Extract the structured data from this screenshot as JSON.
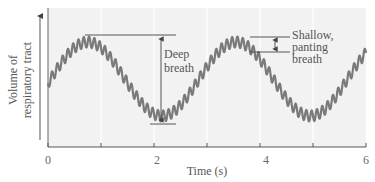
{
  "chart_data": {
    "type": "line",
    "title": "",
    "xlabel": "Time (s)",
    "ylabel": "Volume of respiratory tract",
    "ylabel_lines": [
      "Volume of",
      "respiratory tract"
    ],
    "xlim": [
      0,
      6
    ],
    "x_ticks": [
      0,
      1,
      2,
      3,
      4,
      5,
      6
    ],
    "x_tick_labels": [
      "0",
      "",
      "2",
      "",
      "4",
      "",
      "6"
    ],
    "y_ticks": [],
    "grid": {
      "vertical": true,
      "horizontal": false,
      "at_x": [
        1,
        2,
        3,
        4,
        5
      ]
    },
    "legend": null,
    "series": [
      {
        "name": "Volume of respiratory tract",
        "description": "Slow deep-breath sinusoid (period ~2.8 s) with superimposed rapid shallow panting ripple (~10 Hz)",
        "color": "#7a7a7a",
        "deep_breath": {
          "period_s": 2.8,
          "peaks_at_s": [
            0.75,
            3.55
          ],
          "troughs_at_s": [
            2.15,
            5.1
          ]
        },
        "panting": {
          "frequency_hz": 10,
          "relative_amplitude": 0.09
        },
        "relative_values": {
          "x": [
            0,
            0.75,
            2.15,
            3.55,
            5.1,
            6
          ],
          "y": [
            0.55,
            1.0,
            0.0,
            1.0,
            0.0,
            0.5
          ]
        }
      }
    ],
    "annotations": [
      {
        "text_lines": [
          "Deep",
          "breath"
        ],
        "type": "double-arrow",
        "from": "trough",
        "to": "peak",
        "x_s": 2.05
      },
      {
        "text_lines": [
          "Shallow,",
          "panting",
          "breath"
        ],
        "type": "double-arrow",
        "span": "single panting ripple",
        "x_s": 4.05
      }
    ]
  },
  "axis": {
    "x_title": "Time (s)",
    "y_title_line1": "Volume of",
    "y_title_line2": "respiratory tract",
    "x_tick_labels": [
      "0",
      "2",
      "4",
      "6"
    ]
  },
  "annotations": {
    "deep_line1": "Deep",
    "deep_line2": "breath",
    "shallow_line1": "Shallow,",
    "shallow_line2": "panting",
    "shallow_line3": "breath"
  },
  "colors": {
    "plot_background": "#f2f2f2",
    "trace": "#7a7a7a",
    "axis": "#555555",
    "grid": "#ffffff",
    "annotation": "#444444"
  }
}
